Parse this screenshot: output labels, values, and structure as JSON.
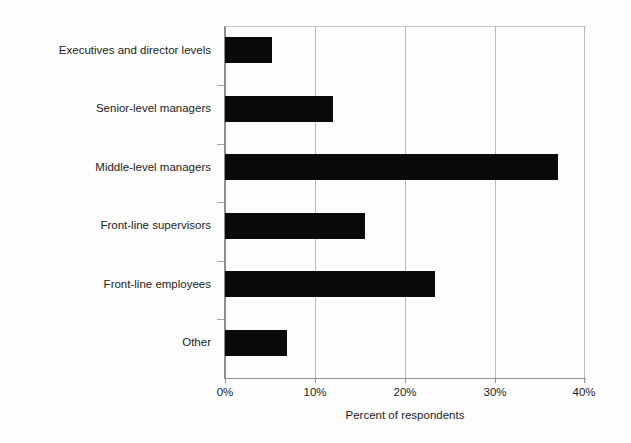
{
  "chart_data": {
    "type": "bar",
    "orientation": "horizontal",
    "title": "",
    "xlabel": "Percent of respondents",
    "ylabel": "",
    "categories": [
      "Executives and director levels",
      "Senior-level managers",
      "Middle-level managers",
      "Front-line supervisors",
      "Front-line employees",
      "Other"
    ],
    "values": [
      5.2,
      12.0,
      37.0,
      15.5,
      23.3,
      6.9
    ],
    "value_suffix": "%",
    "xlim": [
      0,
      40
    ],
    "xticks": [
      0,
      10,
      20,
      30,
      40
    ],
    "xtick_labels": [
      "0%",
      "10%",
      "20%",
      "30%",
      "40%"
    ],
    "grid": "vertical",
    "legend": "none",
    "bar_color": "#0a0a0a",
    "gridline_color": "#b9b9b9",
    "axis_color": "#8f8f8f",
    "background_color": "#fdfdfd"
  }
}
